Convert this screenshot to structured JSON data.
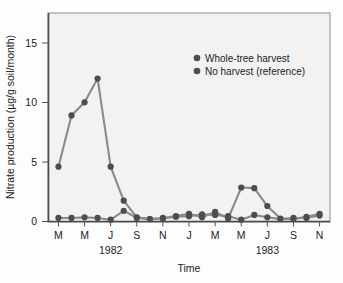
{
  "chart_data": {
    "type": "line",
    "title": "",
    "xlabel": "Time",
    "ylabel": "Nitrate production (µg/g soil/month)",
    "ylim": [
      0,
      17.5
    ],
    "yticks": [
      0,
      5,
      10,
      15
    ],
    "ytick_labels": [
      "0",
      "5",
      "10",
      "15"
    ],
    "grid": false,
    "legend_position": "upper-right",
    "x": [
      1,
      2,
      3,
      4,
      5,
      6,
      7,
      8,
      9,
      10,
      11,
      12,
      13,
      14,
      15,
      16,
      17,
      18,
      19,
      20,
      21
    ],
    "x_tick_positions": [
      1,
      3,
      5,
      7,
      9,
      11,
      13,
      15,
      17,
      19,
      21
    ],
    "xtick_labels": [
      "M",
      "M",
      "J",
      "S",
      "N",
      "J",
      "M",
      "M",
      "J",
      "S",
      "N"
    ],
    "period_labels": [
      {
        "text": "1982",
        "center_tick_index": 2
      },
      {
        "text": "1983",
        "center_tick_index": 8
      }
    ],
    "series": [
      {
        "name": "Whole-tree harvest",
        "color": "#4d4d4d",
        "marker": "circle",
        "values": [
          4.6,
          8.9,
          10.0,
          12.0,
          4.6,
          1.75,
          0.35,
          0.2,
          0.3,
          0.45,
          0.65,
          0.35,
          0.8,
          0.25,
          2.85,
          2.8,
          1.3,
          0.25,
          0.2,
          0.4,
          0.65
        ]
      },
      {
        "name": "No harvest (reference)",
        "color": "#5a5a5a",
        "marker": "circle",
        "values": [
          0.3,
          0.3,
          0.35,
          0.3,
          0.15,
          0.9,
          0.3,
          0.2,
          0.25,
          0.4,
          0.45,
          0.6,
          0.55,
          0.45,
          0.15,
          0.55,
          0.35,
          0.2,
          0.3,
          0.3,
          0.5
        ]
      }
    ]
  },
  "legend": {
    "items": [
      {
        "label": "Whole-tree harvest",
        "color": "#4d4d4d"
      },
      {
        "label": "No harvest (reference)",
        "color": "#4d4d4d"
      }
    ]
  },
  "axes": {
    "x_axis_title": "Time",
    "y_axis_title": "Nitrate production (µg/g soil/month)"
  },
  "colors": {
    "line": "#8a8a8a",
    "marker": "#4d4d4d",
    "axis": "#555555",
    "plot_background": "#f2f2f2",
    "figure_background": "#fdfdfd"
  }
}
